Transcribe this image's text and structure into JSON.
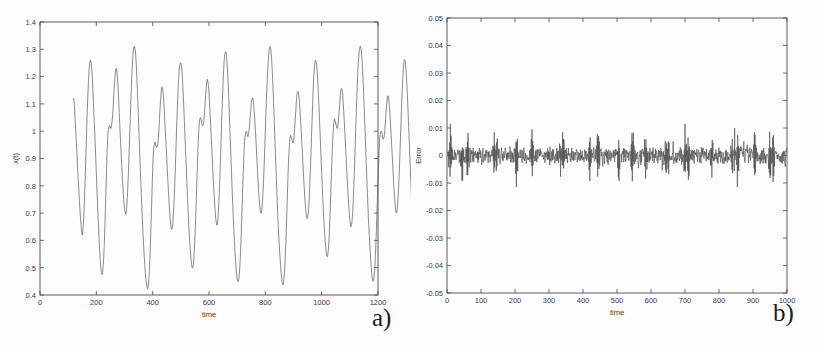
{
  "figure": {
    "background": "#fdfdfd",
    "line_color": "#4d4d4d",
    "axis_color": "#4a4a4a"
  },
  "panel_a": {
    "letter": "a)",
    "chart_title": "",
    "xlabel": "time",
    "ylabel": "x(t)",
    "xticks": [
      "0",
      "200",
      "400",
      "600",
      "800",
      "1000",
      "1200"
    ],
    "yticks": [
      "0.4",
      "0.5",
      "0.6",
      "0.7",
      "0.8",
      "0.9",
      "1",
      "1.1",
      "1.2",
      "1.3",
      "1.4"
    ]
  },
  "panel_b": {
    "letter": "b)",
    "chart_title": "",
    "xlabel": "time",
    "ylabel": "Error",
    "xticks": [
      "0",
      "100",
      "200",
      "300",
      "400",
      "500",
      "600",
      "700",
      "800",
      "900",
      "1000"
    ],
    "yticks": [
      "-0.05",
      "-0.04",
      "-0.03",
      "-0.02",
      "-0.01",
      "0",
      "0.01",
      "0.02",
      "0.03",
      "0.04",
      "0.05"
    ]
  },
  "chart_data": [
    {
      "type": "line",
      "panel": "a",
      "title": "",
      "xlabel": "time",
      "ylabel": "x(t)",
      "xlim": [
        0,
        1200
      ],
      "ylim": [
        0.4,
        1.4
      ],
      "xtick_values": [
        0,
        200,
        400,
        600,
        800,
        1000,
        1200
      ],
      "ytick_values": [
        0.4,
        0.5,
        0.6,
        0.7,
        0.8,
        0.9,
        1.0,
        1.1,
        1.2,
        1.3,
        1.4
      ],
      "grid": false,
      "legend": null,
      "series": [
        {
          "name": "x(t)",
          "color": "#4d4d4d",
          "x_start": 120,
          "x_end": 1122,
          "x_step": 6,
          "values": [
            1.12,
            1.02,
            0.9,
            0.78,
            0.68,
            0.62,
            0.7,
            0.88,
            1.08,
            1.22,
            1.26,
            1.19,
            1.05,
            0.9,
            0.74,
            0.6,
            0.5,
            0.48,
            0.58,
            0.78,
            0.97,
            1.02,
            1.01,
            1.06,
            1.17,
            1.23,
            1.18,
            1.05,
            0.92,
            0.8,
            0.72,
            0.7,
            0.8,
            0.97,
            1.15,
            1.28,
            1.31,
            1.24,
            1.09,
            0.92,
            0.76,
            0.62,
            0.51,
            0.44,
            0.43,
            0.53,
            0.72,
            0.91,
            0.96,
            0.94,
            0.97,
            1.08,
            1.16,
            1.13,
            1.02,
            0.9,
            0.78,
            0.68,
            0.64,
            0.7,
            0.85,
            1.04,
            1.19,
            1.25,
            1.22,
            1.1,
            0.95,
            0.8,
            0.66,
            0.56,
            0.5,
            0.53,
            0.66,
            0.85,
            1.01,
            1.05,
            1.02,
            1.04,
            1.13,
            1.19,
            1.14,
            1.02,
            0.89,
            0.77,
            0.68,
            0.66,
            0.76,
            0.94,
            1.13,
            1.26,
            1.29,
            1.22,
            1.07,
            0.9,
            0.74,
            0.6,
            0.5,
            0.45,
            0.48,
            0.61,
            0.8,
            0.96,
            1.0,
            0.98,
            1.02,
            1.1,
            1.12,
            1.05,
            0.94,
            0.82,
            0.73,
            0.7,
            0.78,
            0.94,
            1.12,
            1.25,
            1.31,
            1.27,
            1.14,
            0.97,
            0.8,
            0.65,
            0.54,
            0.46,
            0.44,
            0.52,
            0.69,
            0.88,
            0.98,
            0.97,
            0.96,
            1.04,
            1.13,
            1.14,
            1.06,
            0.95,
            0.83,
            0.73,
            0.68,
            0.72,
            0.86,
            1.04,
            1.2,
            1.26,
            1.22,
            1.1,
            0.95,
            0.8,
            0.67,
            0.58,
            0.54,
            0.6,
            0.76,
            0.94,
            1.04,
            1.03,
            1.01,
            1.07,
            1.15,
            1.14,
            1.04,
            0.92,
            0.8,
            0.7,
            0.65,
            0.7,
            0.85,
            1.04,
            1.21,
            1.3,
            1.3,
            1.21,
            1.06,
            0.89,
            0.73,
            0.6,
            0.5,
            0.45,
            0.49,
            0.63,
            0.82,
            0.97,
            1.0,
            0.97,
            1.0,
            1.09,
            1.13,
            1.07,
            0.96,
            0.84,
            0.74,
            0.7,
            0.77,
            0.92,
            1.1,
            1.23,
            1.26,
            1.18,
            1.04,
            0.88,
            0.73,
            0.61,
            0.53,
            0.5,
            0.58,
            0.75,
            0.94,
            1.04,
            1.03,
            1.02,
            1.09,
            1.17,
            1.16,
            1.06,
            0.93,
            0.81,
            0.71,
            0.67,
            0.72,
            0.87,
            1.06,
            1.22,
            1.29,
            1.25,
            1.12,
            0.96,
            0.8,
            0.66,
            0.55,
            0.48,
            0.48,
            0.58,
            0.76,
            0.94,
            1.01,
            0.99,
            0.99,
            1.07,
            1.14,
            1.11,
            1.01,
            0.89,
            0.78,
            0.7,
            0.69,
            0.79,
            0.97,
            1.15,
            1.27,
            1.3,
            1.23,
            1.09,
            0.92,
            0.76,
            0.62,
            0.52,
            0.46,
            0.48,
            0.6,
            0.79,
            0.96,
            1.02,
            1.0,
            1.02,
            1.1,
            1.14,
            1.08,
            0.97,
            0.85,
            0.75,
            0.71,
            0.78,
            0.93,
            1.11,
            1.24,
            1.28,
            1.21,
            1.07,
            0.91,
            0.76,
            0.63,
            0.55,
            0.53,
            0.62,
            0.8,
            0.98,
            1.05,
            1.03,
            1.03,
            1.11,
            1.12,
            1.05,
            0.94,
            0.82,
            0.73,
            0.69,
            0.76,
            0.92,
            1.1,
            1.21,
            1.16,
            1.08,
            1.02,
            1.0,
            1.04,
            1.11,
            1.1
          ]
        }
      ]
    },
    {
      "type": "line",
      "panel": "b",
      "title": "",
      "xlabel": "time",
      "ylabel": "Error",
      "xlim": [
        0,
        1000
      ],
      "ylim": [
        -0.05,
        0.05
      ],
      "xtick_values": [
        0,
        100,
        200,
        300,
        400,
        500,
        600,
        700,
        800,
        900,
        1000
      ],
      "ytick_values": [
        -0.05,
        -0.04,
        -0.03,
        -0.02,
        -0.01,
        0,
        0.01,
        0.02,
        0.03,
        0.04,
        0.05
      ],
      "grid": false,
      "legend": null,
      "series": [
        {
          "name": "Error",
          "color": "#4d4d4d",
          "description": "Zero-mean noisy residual, typical band +/-0.003 with intermittent spikes reaching +/-0.010",
          "noise_band": 0.003,
          "spike_amplitude": 0.01,
          "spike_times": [
            10,
            45,
            60,
            140,
            145,
            205,
            250,
            335,
            340,
            420,
            445,
            505,
            545,
            585,
            645,
            650,
            700,
            710,
            780,
            840,
            845,
            855,
            905,
            950,
            960
          ],
          "n_points": 1000
        }
      ]
    }
  ]
}
